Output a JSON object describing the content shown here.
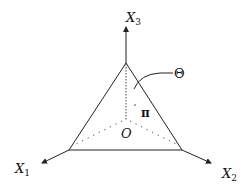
{
  "diagram": {
    "type": "simplex-in-3d-axes",
    "axes": [
      {
        "id": "x1",
        "label": "X",
        "subscript": "1"
      },
      {
        "id": "x2",
        "label": "X",
        "subscript": "2"
      },
      {
        "id": "x3",
        "label": "X",
        "subscript": "3"
      }
    ],
    "origin_label": "O",
    "plane_label": "π",
    "region_label": "Θ",
    "colors": {
      "stroke": "#222222",
      "axis": "#555555",
      "background": "#ffffff"
    }
  }
}
